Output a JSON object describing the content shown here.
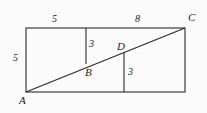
{
  "figure": {
    "background_color": "#fbfbfb",
    "stroke_color": "#2b2b2b",
    "text_color": "#1d1d1d",
    "labels": {
      "top_left_length": "5",
      "top_right_length": "8",
      "left_side_length": "5",
      "upper_segment_length": "3",
      "lower_segment_length": "3",
      "vertex_a": "A",
      "vertex_b": "B",
      "vertex_c": "C",
      "vertex_d": "D"
    },
    "geometry": {
      "rectangle": {
        "x1": 26,
        "y1": 28,
        "x2": 185,
        "y2": 92
      },
      "diagonal": {
        "x1": 26,
        "y1": 92,
        "x2": 185,
        "y2": 28
      },
      "vertical_upper": {
        "x": 86,
        "y1": 28,
        "y2": 64
      },
      "vertical_lower": {
        "x": 124,
        "y1": 52,
        "y2": 92
      },
      "point_b": {
        "x": 86,
        "y": 64
      },
      "point_d": {
        "x": 124,
        "y": 52
      }
    }
  }
}
